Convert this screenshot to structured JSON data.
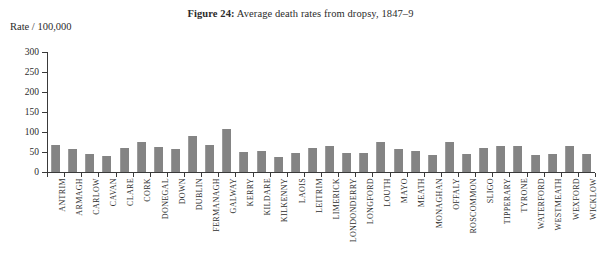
{
  "figure": {
    "label": "Figure 24:",
    "caption": "Average death rates from dropsy, 1847–9"
  },
  "axes": {
    "y_title": "Rate / 100,000",
    "y_ticks": [
      "300",
      "250",
      "200",
      "150",
      "100",
      "50",
      "0"
    ]
  },
  "chart_data": {
    "type": "bar",
    "title": "Figure 24: Average death rates from dropsy, 1847–9",
    "xlabel": "",
    "ylabel": "Rate / 100,000",
    "ylim": [
      0,
      300
    ],
    "ytick_values": [
      0,
      50,
      100,
      150,
      200,
      250,
      300
    ],
    "grid": false,
    "legend": false,
    "bar_color": "#848484",
    "categories": [
      "ANTRIM",
      "ARMAGH",
      "CARLOW",
      "CAVAN",
      "CLARE",
      "CORK",
      "DONEGAL",
      "DOWN",
      "DUBLIN",
      "FERMANAGH",
      "GALWAY",
      "KERRY",
      "KILDARE",
      "KILKENNY",
      "LAOIS",
      "LEITRIM",
      "LIMERICK",
      "LONDONDERRY",
      "LONGFORD",
      "LOUTH",
      "MAYO",
      "MEATH",
      "MONAGHAN",
      "OFFALY",
      "ROSCOMMON",
      "SLIGO",
      "TIPPERARY",
      "TYRONE",
      "WATERFORD",
      "WESTMEATH",
      "WEXFORD",
      "WICKLOW"
    ],
    "values": [
      68,
      57,
      46,
      39,
      60,
      76,
      62,
      57,
      91,
      67,
      108,
      50,
      52,
      38,
      48,
      59,
      66,
      48,
      47,
      74,
      58,
      53,
      42,
      75,
      46,
      60,
      64,
      64,
      42,
      44,
      66,
      46
    ]
  }
}
